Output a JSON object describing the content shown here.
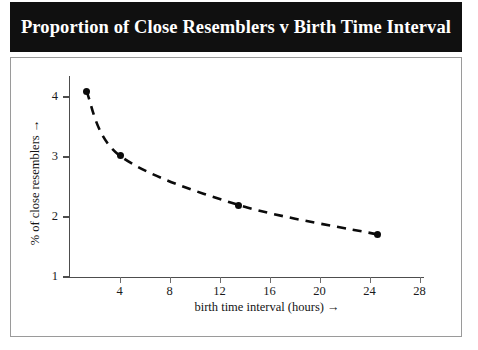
{
  "title": "Proportion of Close Resemblers v Birth Time Interval",
  "colors": {
    "title_bar_bg": "#101010",
    "title_text": "#ffffff",
    "frame_border": "#9a9a9a",
    "axis": "#4d4d4d",
    "series_line": "#0b0b0b",
    "marker": "#0b0b0b",
    "page_bg": "#ffffff"
  },
  "chart_data": {
    "type": "line",
    "title": "Proportion of Close Resemblers v Birth Time Interval",
    "xlabel": "birth time interval (hours) →",
    "ylabel": "% of close resemblers →",
    "xlim": [
      0,
      29
    ],
    "ylim": [
      1,
      4.4
    ],
    "xticks": [
      4,
      8,
      12,
      16,
      20,
      24,
      28
    ],
    "yticks": [
      1,
      2,
      3,
      4
    ],
    "xtick_labels": [
      "4",
      "8",
      "12",
      "16",
      "20",
      "24",
      "28"
    ],
    "ytick_labels": [
      "1",
      "2",
      "3",
      "4"
    ],
    "grid": false,
    "legend": false,
    "line_style": "dashed",
    "marker_style": "filled-circle",
    "series": [
      {
        "name": "% of close resemblers",
        "x": [
          1.3,
          4.0,
          13.5,
          24.6
        ],
        "y": [
          4.1,
          3.02,
          2.2,
          1.71
        ]
      }
    ]
  }
}
